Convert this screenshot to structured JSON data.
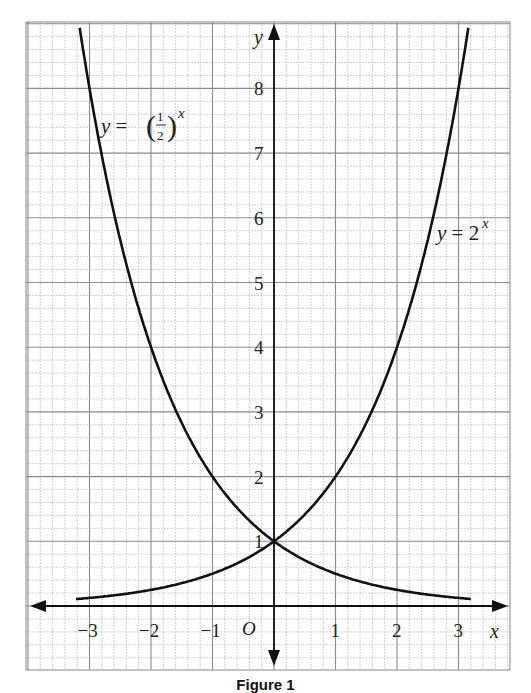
{
  "chart_data": {
    "type": "line",
    "title": "",
    "caption": "Figure 1",
    "xlabel": "x",
    "ylabel": "y",
    "origin_label": "O",
    "xlim": [
      -3.9,
      3.9
    ],
    "ylim": [
      -1,
      9
    ],
    "x_ticks": [
      -3,
      -2,
      -1,
      1,
      2,
      3
    ],
    "x_tick_labels": [
      "−3",
      "−2",
      "−1",
      "1",
      "2",
      "3"
    ],
    "y_ticks": [
      1,
      2,
      3,
      4,
      5,
      6,
      7,
      8
    ],
    "y_tick_labels": [
      "1",
      "2",
      "3",
      "4",
      "5",
      "6",
      "7",
      "8"
    ],
    "grid": true,
    "minor_grid_per_unit": 5,
    "series": [
      {
        "name": "y = 2^x",
        "label_text": "y = 2",
        "label_sup": "x",
        "x": [
          -3.2,
          -3,
          -2,
          -1,
          0,
          1,
          2,
          3,
          3.2
        ],
        "values": [
          0.109,
          0.125,
          0.25,
          0.5,
          1,
          2,
          4,
          8,
          9.19
        ]
      },
      {
        "name": "y = (1/2)^x",
        "label_text": "y = (1/2)",
        "label_sup": "x",
        "x": [
          -3.2,
          -3,
          -2,
          -1,
          0,
          1,
          2,
          3,
          3.2
        ],
        "values": [
          9.19,
          8,
          4,
          2,
          1,
          0.5,
          0.25,
          0.125,
          0.109
        ]
      }
    ],
    "intersection": {
      "x": 0,
      "y": 1
    }
  },
  "colors": {
    "curve": "#111111",
    "axis": "#111111",
    "major_grid": "#8a8a8a",
    "minor_grid": "#c4c4c4",
    "text": "#222222"
  }
}
